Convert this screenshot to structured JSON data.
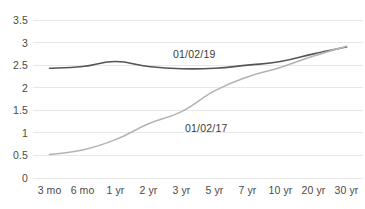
{
  "chart_data": {
    "type": "line",
    "title": "",
    "subtitle": "",
    "xlabel": "",
    "ylabel": "",
    "categories": [
      "3 mo",
      "6 mo",
      "1 yr",
      "2 yr",
      "3 yr",
      "5 yr",
      "7 yr",
      "10 yr",
      "20 yr",
      "30 yr"
    ],
    "yticks": [
      "0",
      "0.5",
      "1",
      "1.5",
      "2",
      "2.5",
      "3",
      "3.5"
    ],
    "ytick_values": [
      0,
      0.5,
      1,
      1.5,
      2,
      2.5,
      3,
      3.5
    ],
    "ylim": [
      0,
      3.5
    ],
    "grid": "horizontal",
    "legend": "inline-annotations",
    "series": [
      {
        "name": "01/02/19",
        "color": "#555555",
        "width": 1.6,
        "values": [
          2.43,
          2.47,
          2.58,
          2.47,
          2.42,
          2.43,
          2.5,
          2.58,
          2.75,
          2.9
        ]
      },
      {
        "name": "01/02/17",
        "color": "#b3b3b3",
        "width": 1.6,
        "values": [
          0.52,
          0.62,
          0.85,
          1.2,
          1.47,
          1.93,
          2.24,
          2.45,
          2.7,
          2.92
        ]
      }
    ],
    "annotations": [
      {
        "text": "01/02/19",
        "series": "01/02/19"
      },
      {
        "text": "01/02/17",
        "series": "01/02/17"
      }
    ],
    "colors": {
      "grid": "#e8e8e8",
      "axis_text": "#4a4a4a",
      "background": "#ffffff"
    }
  }
}
